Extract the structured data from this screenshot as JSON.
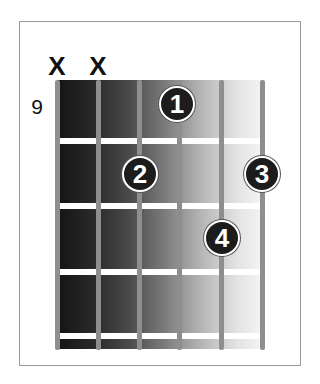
{
  "diagram": {
    "type": "guitar-chord-diagram",
    "start_fret_label": "9",
    "string_markers": [
      {
        "string": 6,
        "marker": "X"
      },
      {
        "string": 5,
        "marker": "X"
      }
    ],
    "fingers": [
      {
        "label": "1",
        "string": 3,
        "fret": 1
      },
      {
        "label": "2",
        "string": 4,
        "fret": 2
      },
      {
        "label": "3",
        "string": 1,
        "fret": 2
      },
      {
        "label": "4",
        "string": 2,
        "fret": 3
      }
    ],
    "num_strings": 6,
    "num_frets_shown": 4,
    "colors": {
      "finger_dot": "#1c1c1c",
      "string": "#8e8e8e",
      "fret": "#ffffff",
      "board_dark": "#141414",
      "board_light": "#f4f4f4"
    }
  }
}
